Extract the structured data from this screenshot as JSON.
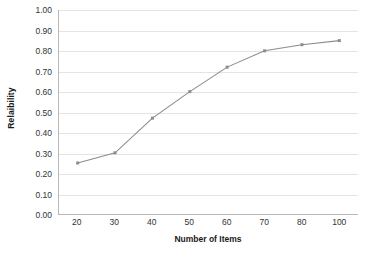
{
  "chart_data": {
    "type": "line",
    "title": "",
    "xlabel": "Number of Items",
    "ylabel": "Relaibility",
    "categories": [
      "20",
      "30",
      "40",
      "50",
      "60",
      "70",
      "80",
      "100"
    ],
    "values": [
      0.25,
      0.3,
      0.47,
      0.6,
      0.72,
      0.8,
      0.83,
      0.85
    ],
    "ylim": [
      0.0,
      1.0
    ],
    "ytick_labels": [
      "0.00",
      "0.10",
      "0.20",
      "0.30",
      "0.40",
      "0.50",
      "0.60",
      "0.70",
      "0.80",
      "0.90",
      "1.00"
    ],
    "ytick_values": [
      0.0,
      0.1,
      0.2,
      0.3,
      0.4,
      0.5,
      0.6,
      0.7,
      0.8,
      0.9,
      1.0
    ],
    "grid": "horizontal",
    "legend": "none",
    "series_color": "#8c8c8c",
    "marker": "square",
    "gridline_color": "#e4e4e4",
    "axis_color": "#b8b8b8"
  }
}
